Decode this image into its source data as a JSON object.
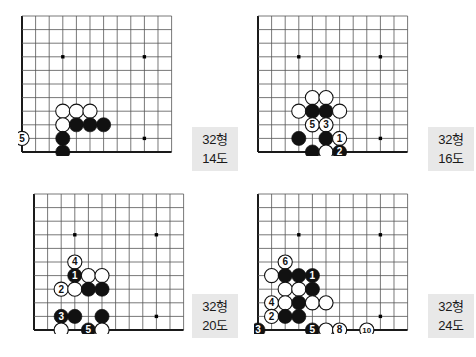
{
  "page": {
    "width": 476,
    "height": 357,
    "background": "#ffffff"
  },
  "board_style": {
    "cols": 12,
    "rows": 11,
    "cell": 13.6,
    "line_color": "#555555",
    "edge_color": "#1a1a1a",
    "star_color": "#000000",
    "black_stone": "#111111",
    "white_stone": "#ffffff",
    "stone_outline": "#111111",
    "black_label_color": "#ffffff",
    "white_label_color": "#111111"
  },
  "diagrams": [
    {
      "id": "diagram-14",
      "position": {
        "left": 18,
        "top": 12
      },
      "caption": {
        "left": 192,
        "top": 127,
        "form": "32형",
        "number": "14도"
      },
      "star_points": [
        {
          "col": 4,
          "row": 4
        },
        {
          "col": 10,
          "row": 4
        },
        {
          "col": 10,
          "row": 10
        }
      ],
      "stones": [
        {
          "col": 4,
          "row": 8,
          "color": "white",
          "label": ""
        },
        {
          "col": 5,
          "row": 8,
          "color": "white",
          "label": ""
        },
        {
          "col": 6,
          "row": 8,
          "color": "white",
          "label": ""
        },
        {
          "col": 4,
          "row": 9,
          "color": "white",
          "label": ""
        },
        {
          "col": 5,
          "row": 9,
          "color": "black",
          "label": ""
        },
        {
          "col": 6,
          "row": 9,
          "color": "black",
          "label": ""
        },
        {
          "col": 7,
          "row": 9,
          "color": "black",
          "label": ""
        },
        {
          "col": 4,
          "row": 10,
          "color": "black",
          "label": ""
        },
        {
          "col": 4,
          "row": 11,
          "color": "black",
          "label": ""
        },
        {
          "col": 1,
          "row": 10,
          "color": "white",
          "label": "5"
        },
        {
          "col": 3,
          "row": 12,
          "color": "white",
          "label": "1"
        },
        {
          "col": 5,
          "row": 12,
          "color": "black",
          "label": "4"
        },
        {
          "col": 6,
          "row": 12,
          "color": "white",
          "label": ""
        },
        {
          "col": 4,
          "row": 13,
          "color": "white",
          "label": "3"
        },
        {
          "col": 5,
          "row": 13,
          "color": "black",
          "label": "2"
        }
      ]
    },
    {
      "id": "diagram-16",
      "position": {
        "left": 254,
        "top": 12
      },
      "caption": {
        "left": 428,
        "top": 127,
        "form": "32형",
        "number": "16도"
      },
      "star_points": [
        {
          "col": 4,
          "row": 4
        },
        {
          "col": 10,
          "row": 4
        },
        {
          "col": 10,
          "row": 10
        }
      ],
      "stones": [
        {
          "col": 5,
          "row": 7,
          "color": "white",
          "label": ""
        },
        {
          "col": 6,
          "row": 7,
          "color": "white",
          "label": ""
        },
        {
          "col": 4,
          "row": 8,
          "color": "white",
          "label": ""
        },
        {
          "col": 5,
          "row": 8,
          "color": "black",
          "label": ""
        },
        {
          "col": 6,
          "row": 8,
          "color": "black",
          "label": ""
        },
        {
          "col": 7,
          "row": 8,
          "color": "white",
          "label": ""
        },
        {
          "col": 5,
          "row": 9,
          "color": "white",
          "label": "5"
        },
        {
          "col": 6,
          "row": 9,
          "color": "white",
          "label": "3"
        },
        {
          "col": 4,
          "row": 10,
          "color": "black",
          "label": ""
        },
        {
          "col": 6,
          "row": 10,
          "color": "black",
          "label": ""
        },
        {
          "col": 7,
          "row": 10,
          "color": "white",
          "label": "1"
        },
        {
          "col": 5,
          "row": 11,
          "color": "black",
          "label": ""
        },
        {
          "col": 6,
          "row": 11,
          "color": "white",
          "label": ""
        },
        {
          "col": 7,
          "row": 11,
          "color": "black",
          "label": "2"
        },
        {
          "col": 6,
          "row": 12,
          "color": "black",
          "label": "4"
        }
      ]
    },
    {
      "id": "diagram-20",
      "position": {
        "left": 30,
        "top": 190
      },
      "caption": {
        "left": 192,
        "top": 294,
        "form": "32형",
        "number": "20도"
      },
      "star_points": [
        {
          "col": 4,
          "row": 4
        },
        {
          "col": 10,
          "row": 4
        },
        {
          "col": 10,
          "row": 10
        }
      ],
      "stones": [
        {
          "col": 4,
          "row": 6,
          "color": "white",
          "label": "4"
        },
        {
          "col": 4,
          "row": 7,
          "color": "black",
          "label": "1"
        },
        {
          "col": 5,
          "row": 7,
          "color": "white",
          "label": ""
        },
        {
          "col": 6,
          "row": 7,
          "color": "white",
          "label": ""
        },
        {
          "col": 3,
          "row": 8,
          "color": "white",
          "label": "2"
        },
        {
          "col": 4,
          "row": 8,
          "color": "white",
          "label": ""
        },
        {
          "col": 5,
          "row": 8,
          "color": "black",
          "label": ""
        },
        {
          "col": 6,
          "row": 8,
          "color": "black",
          "label": ""
        },
        {
          "col": 3,
          "row": 10,
          "color": "black",
          "label": "3"
        },
        {
          "col": 4,
          "row": 10,
          "color": "black",
          "label": ""
        },
        {
          "col": 6,
          "row": 10,
          "color": "black",
          "label": ""
        },
        {
          "col": 3,
          "row": 11,
          "color": "white",
          "label": ""
        },
        {
          "col": 5,
          "row": 11,
          "color": "black",
          "label": "5"
        },
        {
          "col": 6,
          "row": 11,
          "color": "white",
          "label": ""
        }
      ]
    },
    {
      "id": "diagram-24",
      "position": {
        "left": 254,
        "top": 190
      },
      "caption": {
        "left": 428,
        "top": 294,
        "form": "32형",
        "number": "24도"
      },
      "star_points": [
        {
          "col": 4,
          "row": 4
        },
        {
          "col": 10,
          "row": 4
        },
        {
          "col": 10,
          "row": 10
        }
      ],
      "stones": [
        {
          "col": 3,
          "row": 6,
          "color": "white",
          "label": "6"
        },
        {
          "col": 2,
          "row": 7,
          "color": "white",
          "label": ""
        },
        {
          "col": 3,
          "row": 7,
          "color": "black",
          "label": ""
        },
        {
          "col": 4,
          "row": 7,
          "color": "black",
          "label": ""
        },
        {
          "col": 5,
          "row": 7,
          "color": "black",
          "label": "1"
        },
        {
          "col": 3,
          "row": 8,
          "color": "white",
          "label": ""
        },
        {
          "col": 4,
          "row": 8,
          "color": "white",
          "label": ""
        },
        {
          "col": 5,
          "row": 8,
          "color": "black",
          "label": ""
        },
        {
          "col": 2,
          "row": 9,
          "color": "white",
          "label": "4"
        },
        {
          "col": 3,
          "row": 9,
          "color": "white",
          "label": ""
        },
        {
          "col": 4,
          "row": 9,
          "color": "black",
          "label": ""
        },
        {
          "col": 5,
          "row": 9,
          "color": "white",
          "label": ""
        },
        {
          "col": 6,
          "row": 9,
          "color": "white",
          "label": ""
        },
        {
          "col": 2,
          "row": 10,
          "color": "white",
          "label": "2"
        },
        {
          "col": 3,
          "row": 10,
          "color": "black",
          "label": ""
        },
        {
          "col": 4,
          "row": 10,
          "color": "black",
          "label": ""
        },
        {
          "col": 1,
          "row": 11,
          "color": "black",
          "label": "3"
        },
        {
          "col": 5,
          "row": 11,
          "color": "black",
          "label": "5"
        },
        {
          "col": 6,
          "row": 11,
          "color": "white",
          "label": ""
        },
        {
          "col": 7,
          "row": 11,
          "color": "white",
          "label": "8"
        },
        {
          "col": 9,
          "row": 11,
          "color": "white",
          "label": "10"
        },
        {
          "col": 6,
          "row": 12,
          "color": "black",
          "label": "7"
        },
        {
          "col": 7,
          "row": 12,
          "color": "black",
          "label": "9"
        }
      ]
    }
  ]
}
